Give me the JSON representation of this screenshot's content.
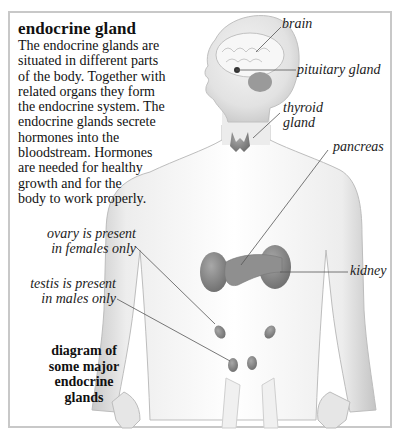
{
  "title": "endocrine gland",
  "description_lines": [
    "The endocrine glands are",
    "situated in different parts",
    "of the body. Together with",
    "related organs they form",
    "the endocrine system. The",
    "endocrine glands secrete",
    "hormones into the",
    "bloodstream. Hormones",
    "are needed for healthy",
    "growth and for the",
    "body to work properly."
  ],
  "labels": {
    "brain": "brain",
    "pituitary": "pituitary gland",
    "thyroid_line1": "thyroid",
    "thyroid_line2": "gland",
    "pancreas": "pancreas",
    "kidney": "kidney",
    "ovary_line1": "ovary is present",
    "ovary_line2": "in females only",
    "testis_line1": "testis is present",
    "testis_line2": "in males only"
  },
  "caption_lines": [
    "diagram of",
    "some major",
    "endocrine",
    "glands"
  ],
  "colors": {
    "frame": "#c8c8c8",
    "body_shade": "#d9d9d9",
    "gland": "#8a8a8a",
    "leader_line": "#555555"
  }
}
